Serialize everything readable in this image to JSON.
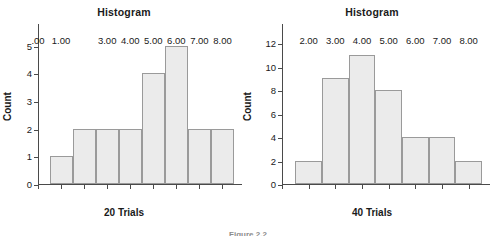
{
  "figure": {
    "caption": "Figure 2.2"
  },
  "panels": [
    {
      "id": "left",
      "title": "Histogram",
      "xlabel": "20 Trials",
      "ylabel": "Count"
    },
    {
      "id": "right",
      "title": "Histogram",
      "xlabel": "40 Trials",
      "ylabel": "Count"
    }
  ],
  "chart_data": [
    {
      "type": "bar",
      "title": "Histogram",
      "xlabel": "20 Trials",
      "ylabel": "Count",
      "bin_centers": [
        1.0,
        2.0,
        3.0,
        4.0,
        5.0,
        6.0,
        7.0,
        8.0
      ],
      "categories": [
        "1.00",
        "2.00",
        "3.00",
        "4.00",
        "5.00",
        "6.00",
        "7.00",
        "8.00"
      ],
      "values": [
        1,
        2,
        2,
        2,
        4,
        5,
        2,
        2
      ],
      "total": 20,
      "bin_width": 1.0,
      "xlim": [
        0.0,
        8.5
      ],
      "ylim": [
        0,
        5.6
      ],
      "xticks": [
        0.0,
        1.0,
        2.0,
        3.0,
        4.0,
        5.0,
        6.0,
        7.0,
        8.0
      ],
      "xticklabels": [
        ".00",
        "1.00",
        "",
        "3.00",
        "4.00",
        "5.00",
        "6.00",
        "7.00",
        "8.00"
      ],
      "yticks": [
        0,
        1,
        2,
        3,
        4,
        5
      ],
      "yticklabels": [
        "0",
        "1",
        "2",
        "3",
        "4",
        "5"
      ],
      "grid": false,
      "legend": "none",
      "bar_fill": "#ebebeb",
      "bar_edge": "#9a9a9a"
    },
    {
      "type": "bar",
      "title": "Histogram",
      "xlabel": "40 Trials",
      "ylabel": "Count",
      "bin_centers": [
        2.0,
        3.0,
        4.0,
        5.0,
        6.0,
        7.0,
        8.0
      ],
      "categories": [
        "2.00",
        "3.00",
        "4.00",
        "5.00",
        "6.00",
        "7.00",
        "8.00"
      ],
      "values": [
        2,
        9,
        11,
        8,
        4,
        4,
        2
      ],
      "total": 40,
      "bin_width": 1.0,
      "xlim": [
        1.0,
        8.5
      ],
      "ylim": [
        0,
        13.2
      ],
      "xticks": [
        1.0,
        2.0,
        3.0,
        4.0,
        5.0,
        6.0,
        7.0,
        8.0
      ],
      "xticklabels": [
        "",
        "2.00",
        "3.00",
        "4.00",
        "5.00",
        "6.00",
        "7.00",
        "8.00"
      ],
      "yticks": [
        0,
        2,
        4,
        6,
        8,
        10,
        12
      ],
      "yticklabels": [
        "0",
        "2",
        "4",
        "6",
        "8",
        "10",
        "12"
      ],
      "grid": false,
      "legend": "none",
      "bar_fill": "#ebebeb",
      "bar_edge": "#9a9a9a"
    }
  ]
}
